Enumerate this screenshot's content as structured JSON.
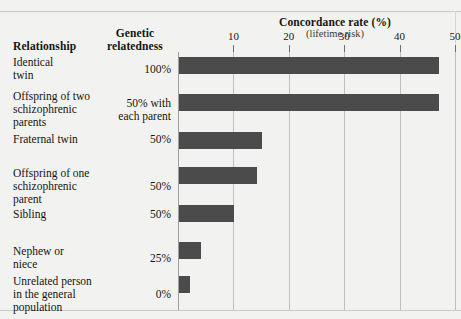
{
  "figure": {
    "scan_remnant": "",
    "columns": {
      "relationship_header": "Relationship",
      "genetic_header_line1": "Genetic",
      "genetic_header_line2": "relatedness"
    },
    "axis_title": "Concordance rate (%)",
    "axis_subtitle": "(lifetime risk)"
  },
  "chart_data": {
    "type": "bar",
    "orientation": "horizontal",
    "title": "Concordance rate (%)",
    "subtitle": "(lifetime risk)",
    "xlabel": "Concordance rate (%)",
    "ylabel": "Relationship",
    "xlim": [
      0,
      50
    ],
    "xticks": [
      10,
      20,
      30,
      40,
      50
    ],
    "xtick_labels": [
      "10",
      "20",
      "30",
      "40",
      "50"
    ],
    "grid": true,
    "legend": "none",
    "bar_color": "#4b4b4b",
    "background_color": "#f2f2f1",
    "categories": [
      "Identical twin",
      "Offspring of two schizophrenic parents",
      "Fraternal twin",
      "Offspring of one schizophrenic parent",
      "Sibling",
      "Nephew or niece",
      "Unrelated person in the general population"
    ],
    "values": [
      47,
      47,
      15,
      14,
      10,
      4,
      2
    ],
    "genetic_relatedness": [
      "100%",
      "50% with each parent",
      "50%",
      "50%",
      "50%",
      "25%",
      "0%"
    ]
  },
  "rows": [
    {
      "label_lines": [
        "Identical",
        "twin"
      ],
      "relatedness_lines": [
        "100%"
      ],
      "value": 47
    },
    {
      "label_lines": [
        "Offspring of two",
        "schizophrenic",
        "parents"
      ],
      "relatedness_lines": [
        "50% with",
        "each parent"
      ],
      "value": 47
    },
    {
      "label_lines": [
        "Fraternal twin"
      ],
      "relatedness_lines": [
        "50%"
      ],
      "value": 15
    },
    {
      "label_lines": [
        "Offspring of one",
        "schizophrenic",
        "parent"
      ],
      "relatedness_lines": [
        "50%"
      ],
      "value": 14
    },
    {
      "label_lines": [
        "Sibling"
      ],
      "relatedness_lines": [
        "50%"
      ],
      "value": 10
    },
    {
      "label_lines": [
        "Nephew or",
        "niece"
      ],
      "relatedness_lines": [
        "25%"
      ],
      "value": 4
    },
    {
      "label_lines": [
        "Unrelated person",
        "in the general",
        "population"
      ],
      "relatedness_lines": [
        "0%"
      ],
      "value": 2
    }
  ]
}
